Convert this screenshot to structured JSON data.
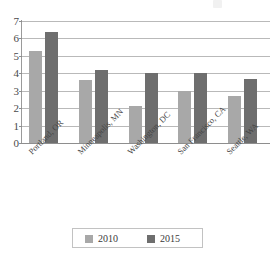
{
  "chart_data": {
    "type": "bar",
    "title": "",
    "xlabel": "",
    "ylabel": "",
    "categories": [
      "Portland, OR",
      "Minneapolis, MN",
      "Washington, DC",
      "San Francisco, CA",
      "Seattle, WA"
    ],
    "series": [
      {
        "name": "2010",
        "color": "#a8a8a8",
        "values": [
          5.3,
          3.6,
          2.15,
          3.0,
          2.7
        ]
      },
      {
        "name": "2015",
        "color": "#6e6e6e",
        "values": [
          6.35,
          4.2,
          4.0,
          4.0,
          3.65
        ]
      }
    ],
    "ylim": [
      0,
      7
    ],
    "ytick_labels": [
      "0",
      "1",
      "2",
      "3",
      "4",
      "5",
      "6",
      "7"
    ],
    "ytick_values": [
      0,
      1,
      2,
      3,
      4,
      5,
      6,
      7
    ],
    "grid": true,
    "legend_position": "bottom"
  },
  "legend": {
    "entries": [
      {
        "label": "2010"
      },
      {
        "label": "2015"
      }
    ]
  }
}
